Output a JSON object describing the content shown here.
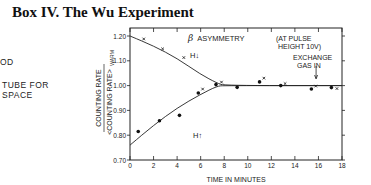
{
  "page": {
    "title": "Box IV. The Wu Experiment",
    "side_text": [
      "OD",
      "TUBE FOR",
      "SPACE"
    ]
  },
  "chart_data": {
    "type": "scatter",
    "annotations": [
      "(AT PULSE HEIGHT 10V)",
      "EXCHANGE GAS IN",
      "H↓",
      "H↑"
    ],
    "xlabel": "TIME IN MINUTES",
    "ylabel": "COUNTING RATE / <COUNTING RATE>WARM",
    "ylabel_num": "COUNTING RATE",
    "ylabel_den": "<COUNTING RATE>",
    "ylabel_sub": "WARM",
    "xlim": [
      0,
      18
    ],
    "ylim": [
      0.7,
      1.2
    ],
    "x_ticks": [
      "0",
      "2",
      "4",
      "6",
      "8",
      "10",
      "12",
      "14",
      "16",
      "18"
    ],
    "y_ticks": [
      "0.70",
      "0.80",
      "0.90",
      "1.00",
      "1.10",
      "1.20"
    ],
    "grid": false,
    "exchange_gas_time": 15.8,
    "series": [
      {
        "name": "H↓ (x markers)",
        "marker": "x",
        "points": [
          [
            1.0,
            1.18
          ],
          [
            2.6,
            1.14
          ],
          [
            4.4,
            1.105
          ],
          [
            6.0,
            0.978
          ],
          [
            7.6,
            1.006
          ],
          [
            11.2,
            1.022
          ],
          [
            13.0,
            1.0
          ],
          [
            15.6,
            0.99
          ],
          [
            17.4,
            0.98
          ]
        ]
      },
      {
        "name": "H↑ (dot markers)",
        "marker": "dot",
        "points": [
          [
            0.7,
            0.815
          ],
          [
            2.5,
            0.858
          ],
          [
            4.2,
            0.88
          ],
          [
            5.8,
            0.97
          ],
          [
            7.3,
            1.004
          ],
          [
            9.1,
            0.993
          ],
          [
            11.0,
            1.015
          ],
          [
            12.8,
            1.0
          ],
          [
            15.4,
            0.986
          ],
          [
            17.1,
            0.992
          ]
        ]
      },
      {
        "name": "H↓ fit curve",
        "marker": "line",
        "points": [
          [
            0,
            1.2
          ],
          [
            2,
            1.16
          ],
          [
            4,
            1.11
          ],
          [
            6,
            1.045
          ],
          [
            7.4,
            1.01
          ],
          [
            8,
            1.0
          ],
          [
            18,
            1.0
          ]
        ]
      },
      {
        "name": "H↑ fit curve",
        "marker": "line",
        "points": [
          [
            0,
            0.76
          ],
          [
            2,
            0.84
          ],
          [
            4,
            0.91
          ],
          [
            6,
            0.965
          ],
          [
            7.4,
            0.998
          ],
          [
            8,
            1.0
          ],
          [
            18,
            1.0
          ]
        ]
      }
    ]
  }
}
